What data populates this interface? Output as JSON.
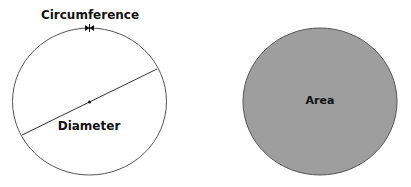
{
  "diagram": {
    "left_circle": {
      "circumference_label": "Circumference",
      "diameter_label": "Diameter",
      "stroke_color": "#555555"
    },
    "right_circle": {
      "area_label": "Area",
      "fill_color": "#9e9e9e",
      "stroke_color": "#555555"
    }
  }
}
